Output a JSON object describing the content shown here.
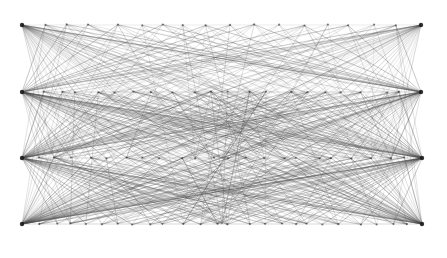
{
  "figure": {
    "type": "network-graph",
    "title": "",
    "width": 447,
    "height": 258,
    "background_color": "#ffffff"
  },
  "chart_data": {
    "type": "scatter",
    "title": "",
    "xlabel": "",
    "ylabel": "",
    "xlim": [
      0,
      447
    ],
    "ylim": [
      0,
      258
    ],
    "grid": false,
    "legend": null,
    "edge_color": "#4a4a4a",
    "edge_width": 0.45,
    "edge_opacity": 0.72,
    "node_color": "#2b2b2b",
    "node_radius": 1.1,
    "hub_color": "#1a1a1a",
    "hub_radius": 2.2,
    "rows": [
      {
        "name": "row-1",
        "y": 25,
        "left_hub_x": 22,
        "right_hub_x": 421,
        "node_count": 18,
        "density": "low"
      },
      {
        "name": "row-2",
        "y": 92,
        "left_hub_x": 22,
        "right_hub_x": 421,
        "node_count": 22,
        "density": "medium"
      },
      {
        "name": "row-3",
        "y": 158,
        "left_hub_x": 22,
        "right_hub_x": 422,
        "node_count": 24,
        "density": "high"
      },
      {
        "name": "row-4",
        "y": 224,
        "left_hub_x": 22,
        "right_hub_x": 422,
        "node_count": 26,
        "density": "high"
      }
    ],
    "hubs": [
      {
        "name": "hub-top-left",
        "x": 22,
        "y": 25,
        "degree": 26
      },
      {
        "name": "hub-top-right",
        "x": 421,
        "y": 25,
        "degree": 26
      },
      {
        "name": "hub-mid1-left",
        "x": 22,
        "y": 92,
        "degree": 30
      },
      {
        "name": "hub-mid1-right",
        "x": 421,
        "y": 92,
        "degree": 30
      },
      {
        "name": "hub-mid2-left",
        "x": 22,
        "y": 158,
        "degree": 32
      },
      {
        "name": "hub-mid2-right",
        "x": 422,
        "y": 158,
        "degree": 32
      },
      {
        "name": "hub-bottom-left",
        "x": 22,
        "y": 224,
        "degree": 34
      },
      {
        "name": "hub-bottom-right",
        "x": 422,
        "y": 224,
        "degree": 34
      }
    ],
    "crossing_points": [
      {
        "name": "crossing-row2-center",
        "x": 222,
        "y": 92
      },
      {
        "name": "crossing-row3-center",
        "x": 222,
        "y": 158
      },
      {
        "name": "crossing-row4-center",
        "x": 222,
        "y": 224
      },
      {
        "name": "crossing-upper-x",
        "x": 222,
        "y": 55
      }
    ],
    "edge_bundles": [
      {
        "name": "top-left-fan",
        "origin": "hub-top-left",
        "spread_rows": [
          2,
          3,
          4
        ],
        "count": 24
      },
      {
        "name": "top-right-fan",
        "origin": "hub-top-right",
        "spread_rows": [
          2,
          3,
          4
        ],
        "count": 24
      },
      {
        "name": "mid1-left-fan",
        "origin": "hub-mid1-left",
        "spread_rows": [
          1,
          3,
          4
        ],
        "count": 28
      },
      {
        "name": "mid1-right-fan",
        "origin": "hub-mid1-right",
        "spread_rows": [
          1,
          3,
          4
        ],
        "count": 28
      },
      {
        "name": "mid2-left-fan",
        "origin": "hub-mid2-left",
        "spread_rows": [
          1,
          2,
          4
        ],
        "count": 30
      },
      {
        "name": "mid2-right-fan",
        "origin": "hub-mid2-right",
        "spread_rows": [
          1,
          2,
          4
        ],
        "count": 30
      },
      {
        "name": "bottom-left-fan",
        "origin": "hub-bottom-left",
        "spread_rows": [
          1,
          2,
          3
        ],
        "count": 32
      },
      {
        "name": "bottom-right-fan",
        "origin": "hub-bottom-right",
        "spread_rows": [
          1,
          2,
          3
        ],
        "count": 32
      }
    ]
  }
}
